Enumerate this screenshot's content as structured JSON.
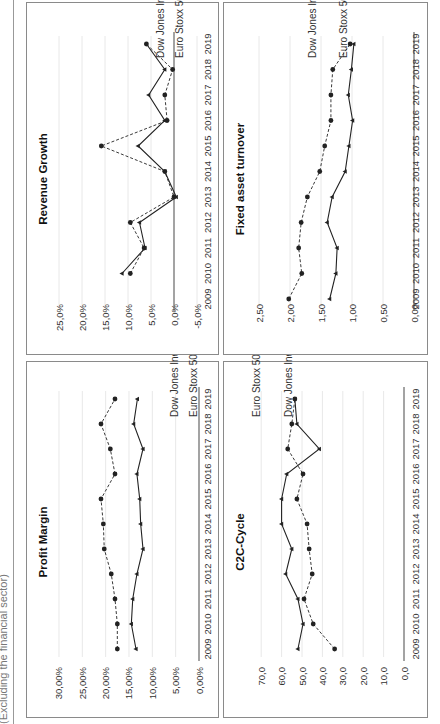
{
  "caption": "(Excluding the financial sector)",
  "legend": {
    "dow": "Dow Jones Ind.",
    "euro": "Euro Stoxx 50"
  },
  "colors": {
    "series": "#222222",
    "grid": "#e8e8e8",
    "border": "#8a8a8a"
  },
  "chart_data": [
    {
      "id": "profit",
      "type": "line",
      "title": "Profit Margin",
      "xlabel": "",
      "ylabel": "",
      "categories": [
        "2009",
        "2010",
        "2011",
        "2012",
        "2013",
        "2014",
        "2015",
        "2016",
        "2017",
        "2018",
        "2019"
      ],
      "yticks": [
        "0,00%",
        "5,00%",
        "10,00%",
        "15,00%",
        "20,00%",
        "25,00%",
        "30,00%"
      ],
      "ylim": [
        0,
        30
      ],
      "series": [
        {
          "name": "Dow Jones Ind.",
          "style": "dashed",
          "values": [
            17.5,
            17.5,
            18.0,
            18.8,
            20.3,
            20.5,
            21.0,
            18.0,
            19.0,
            21.0,
            18.0
          ]
        },
        {
          "name": "Euro Stoxx 50",
          "style": "solid",
          "values": [
            13.5,
            14.5,
            14.2,
            13.3,
            12.0,
            12.5,
            12.7,
            13.3,
            12.0,
            14.0,
            13.2
          ]
        }
      ],
      "grid": true
    },
    {
      "id": "revenue",
      "type": "line",
      "title": "Revenue Growth",
      "xlabel": "",
      "ylabel": "",
      "categories": [
        "2009",
        "2010",
        "2011",
        "2012",
        "2013",
        "2014",
        "2015",
        "2016",
        "2017",
        "2018",
        "2019"
      ],
      "yticks": [
        "-5,0%",
        "0,0%",
        "5,0%",
        "10,0%",
        "15,0%",
        "20,0%",
        "25,0%"
      ],
      "ylim": [
        -5,
        25
      ],
      "series": [
        {
          "name": "Dow Jones Ind.",
          "style": "dashed",
          "values": [
            null,
            9.5,
            6.5,
            9.5,
            0.0,
            2.0,
            15.8,
            1.5,
            2.0,
            0.3,
            6.0
          ]
        },
        {
          "name": "Euro Stoxx 50",
          "style": "solid",
          "values": [
            null,
            11.3,
            6.3,
            7.5,
            -0.5,
            2.0,
            7.8,
            2.0,
            5.5,
            2.0,
            6.0
          ]
        }
      ],
      "grid": true
    },
    {
      "id": "c2c",
      "type": "line",
      "title": "C2C-Cycle",
      "xlabel": "",
      "ylabel": "",
      "categories": [
        "2009",
        "2010",
        "2011",
        "2012",
        "2013",
        "2014",
        "2015",
        "2016",
        "2017",
        "2018",
        "2019"
      ],
      "yticks": [
        "0,0",
        "10,0",
        "20,0",
        "30,0",
        "40,0",
        "50,0",
        "60,0",
        "70,0"
      ],
      "ylim": [
        0,
        70
      ],
      "series": [
        {
          "name": "Dow Jones Ind.",
          "style": "dashed",
          "values": [
            34.0,
            44.5,
            49.0,
            45.0,
            46.5,
            47.5,
            52.5,
            49.5,
            57.0,
            55.0,
            53.5
          ]
        },
        {
          "name": "Euro Stoxx 50",
          "style": "solid",
          "values": [
            52.0,
            49.5,
            52.0,
            58.0,
            55.0,
            60.0,
            60.0,
            57.5,
            41.5,
            52.5,
            53.5
          ]
        }
      ],
      "grid": true
    },
    {
      "id": "fat",
      "type": "line",
      "title": "Fixed asset turnover",
      "xlabel": "",
      "ylabel": "",
      "categories": [
        "2009",
        "2010",
        "2011",
        "2012",
        "2013",
        "2014",
        "2015",
        "2016",
        "2017",
        "2018",
        "2019"
      ],
      "yticks": [
        "0,00",
        "0,50",
        "1,00",
        "1,50",
        "2,00",
        "2,50"
      ],
      "ylim": [
        0,
        2.5
      ],
      "series": [
        {
          "name": "Dow Jones Ind.",
          "style": "dashed",
          "values": [
            2.02,
            1.81,
            1.86,
            1.82,
            1.72,
            1.52,
            1.44,
            1.34,
            1.34,
            1.31,
            1.03
          ]
        },
        {
          "name": "Euro Stoxx 50",
          "style": "solid",
          "values": [
            1.36,
            1.26,
            1.24,
            1.4,
            1.32,
            1.11,
            1.05,
            0.99,
            1.06,
            1.01,
            0.97
          ]
        }
      ],
      "grid": true
    }
  ]
}
